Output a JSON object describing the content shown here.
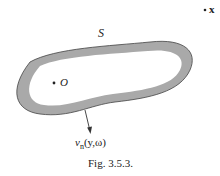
{
  "figure": {
    "caption": "Fig. 3.5.3.",
    "surface_label": "S",
    "origin_label": "O",
    "point_label": "x",
    "normal_velocity_label": {
      "symbol": "v",
      "subscript": "n",
      "args": "(y,ω)"
    },
    "colors": {
      "ring_fill": "#a9a9a9",
      "inner_fill": "#ffffff",
      "outline": "#333333",
      "text": "#222222"
    }
  }
}
